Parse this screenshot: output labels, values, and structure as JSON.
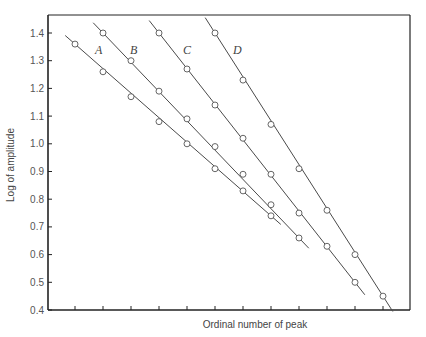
{
  "chart_data": {
    "type": "line",
    "title": "",
    "xlabel": "Ordinal number of peak",
    "ylabel": "Log of amplitude",
    "ylim": [
      0.4,
      1.45
    ],
    "yticks": [
      0.4,
      0.5,
      0.6,
      0.7,
      0.8,
      0.9,
      1.0,
      1.1,
      1.2,
      1.3,
      1.4
    ],
    "ytick_labels": [
      "0.4",
      "0.5",
      "0.6",
      "0.7",
      "0.8",
      "0.9",
      "1.0",
      "1.1",
      "1.2",
      "1.3",
      "1.4"
    ],
    "xticks_count": 12,
    "xtick_labels": [],
    "grid": false,
    "legend": "inline labels",
    "marker": "open circle",
    "series": [
      {
        "name": "A",
        "x": [
          1,
          2,
          3,
          4,
          5,
          6,
          7,
          8
        ],
        "values": [
          1.36,
          1.26,
          1.17,
          1.08,
          1.0,
          0.91,
          0.83,
          0.74
        ]
      },
      {
        "name": "B",
        "x": [
          2,
          3,
          4,
          5,
          6,
          7,
          8,
          9
        ],
        "values": [
          1.4,
          1.3,
          1.19,
          1.09,
          0.99,
          0.89,
          0.78,
          0.66
        ]
      },
      {
        "name": "C",
        "x": [
          4,
          5,
          6,
          7,
          8,
          9,
          10,
          11
        ],
        "values": [
          1.4,
          1.27,
          1.14,
          1.02,
          0.89,
          0.75,
          0.63,
          0.5
        ]
      },
      {
        "name": "D",
        "x": [
          6,
          7,
          8,
          9,
          10,
          11,
          12
        ],
        "values": [
          1.4,
          1.23,
          1.07,
          0.91,
          0.76,
          0.6,
          0.45
        ]
      }
    ]
  },
  "layout": {
    "frame": {
      "left": 48,
      "top": 15,
      "right": 410,
      "bottom": 310
    },
    "y_px": {
      "v0": 0.4,
      "p0": 310,
      "v1": 1.4,
      "p1": 33
    },
    "x_px": {
      "x1": 75,
      "step": 28
    },
    "line_extend": 0.35,
    "label_pos": {
      "A": [
        95,
        54
      ],
      "B": [
        130,
        54
      ],
      "C": [
        183,
        54
      ],
      "D": [
        233,
        54
      ]
    },
    "colors": {
      "axis": "#222222",
      "line": "#4a4a4a",
      "marker_fill": "#ffffff",
      "marker_stroke": "#555555"
    }
  }
}
